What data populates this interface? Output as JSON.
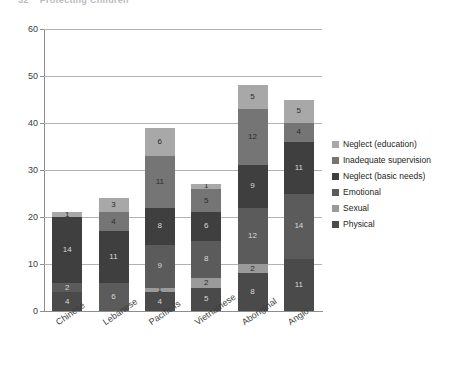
{
  "page_header": {
    "number": "32",
    "title": "Protecting Children"
  },
  "legend": {
    "position": "right",
    "items": [
      {
        "label": "Neglect (education)",
        "color": "#a8a8a8"
      },
      {
        "label": "Inadequate supervision",
        "color": "#757575"
      },
      {
        "label": "Neglect (basic needs)",
        "color": "#3f3f3f"
      },
      {
        "label": "Emotional",
        "color": "#5b5b5b"
      },
      {
        "label": "Sexual",
        "color": "#9a9a9a"
      },
      {
        "label": "Physical",
        "color": "#4a4a4a"
      }
    ]
  },
  "chart_data": {
    "type": "bar",
    "subtype": "stacked",
    "title": "",
    "xlabel": "",
    "ylabel": "",
    "ylim": [
      0,
      60
    ],
    "yticks": [
      "0",
      "10",
      "20",
      "30",
      "40",
      "50",
      "60"
    ],
    "grid": true,
    "categories": [
      "Chinese",
      "Lebanese",
      "Pacific Is",
      "Vietnamese",
      "Aboriginal",
      "Anglo"
    ],
    "series": [
      {
        "name": "Physical",
        "color": "#4a4a4a",
        "values": [
          4,
          0,
          4,
          5,
          8,
          11
        ]
      },
      {
        "name": "Sexual",
        "color": "#9a9a9a",
        "values": [
          0,
          0,
          1,
          2,
          2,
          0
        ]
      },
      {
        "name": "Emotional",
        "color": "#5b5b5b",
        "values": [
          2,
          6,
          9,
          8,
          12,
          14
        ]
      },
      {
        "name": "Neglect (basic needs)",
        "color": "#3f3f3f",
        "values": [
          14,
          11,
          8,
          6,
          9,
          11
        ]
      },
      {
        "name": "Inadequate supervision",
        "color": "#757575",
        "values": [
          0,
          4,
          11,
          5,
          12,
          4
        ]
      },
      {
        "name": "Neglect (education)",
        "color": "#a8a8a8",
        "values": [
          1,
          3,
          6,
          1,
          5,
          5
        ]
      }
    ],
    "totals": [
      21,
      24,
      39,
      27,
      48,
      45
    ]
  }
}
